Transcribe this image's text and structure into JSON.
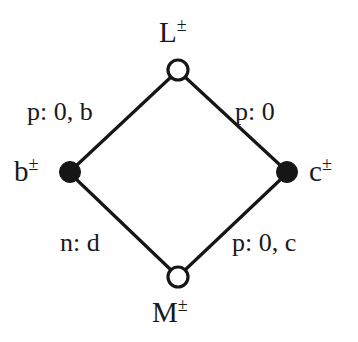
{
  "diagram": {
    "type": "commutative-diamond",
    "background_color": "#ffffff",
    "stroke_color": "#161616",
    "nodes": [
      {
        "id": "L",
        "position": "top",
        "base": "L",
        "superscript": "±",
        "label": "L±",
        "marker": "open-circle",
        "fill": "#ffffff",
        "cx": 178,
        "cy": 70,
        "r": 10
      },
      {
        "id": "b",
        "position": "left",
        "base": "b",
        "superscript": "±",
        "label": "b±",
        "marker": "filled-circle",
        "fill": "#161616",
        "cx": 70,
        "cy": 172,
        "r": 10
      },
      {
        "id": "c",
        "position": "right",
        "base": "c",
        "superscript": "±",
        "label": "c±",
        "marker": "filled-circle",
        "fill": "#161616",
        "cx": 287,
        "cy": 172,
        "r": 10
      },
      {
        "id": "M",
        "position": "bottom",
        "base": "M",
        "superscript": "±",
        "label": "M±",
        "marker": "open-circle",
        "fill": "#ffffff",
        "cx": 178,
        "cy": 277,
        "r": 10
      }
    ],
    "edges": [
      {
        "id": "L-b",
        "from": "L",
        "to": "b",
        "side": "upper-left",
        "label": "p: 0, b"
      },
      {
        "id": "L-c",
        "from": "L",
        "to": "c",
        "side": "upper-right",
        "label": "p: 0"
      },
      {
        "id": "b-M",
        "from": "b",
        "to": "M",
        "side": "lower-left",
        "label": "n: d"
      },
      {
        "id": "M-c",
        "from": "M",
        "to": "c",
        "side": "lower-right",
        "label": "p: 0, c"
      }
    ]
  }
}
